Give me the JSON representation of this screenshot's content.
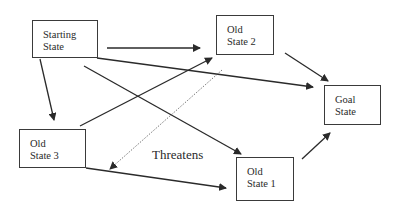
{
  "nodes": {
    "starting": {
      "line1": "Starting",
      "line2": "State"
    },
    "old2": {
      "line1": "Old",
      "line2": "State 2"
    },
    "goal": {
      "line1": "Goal",
      "line2": "State"
    },
    "old3": {
      "line1": "Old",
      "line2": "State 3"
    },
    "old1": {
      "line1": "Old",
      "line2": "State 1"
    }
  },
  "edges": [
    {
      "from": "Starting State",
      "to": "Old State 2",
      "style": "solid"
    },
    {
      "from": "Starting State",
      "to": "Goal State",
      "style": "solid"
    },
    {
      "from": "Starting State",
      "to": "Old State 3",
      "style": "solid"
    },
    {
      "from": "Starting State",
      "to": "Old State 1",
      "style": "solid"
    },
    {
      "from": "Old State 3",
      "to": "Old State 2",
      "style": "solid"
    },
    {
      "from": "Old State 3",
      "to": "Old State 1",
      "style": "solid"
    },
    {
      "from": "Old State 2",
      "to": "Goal State",
      "style": "solid"
    },
    {
      "from": "Old State 1",
      "to": "Goal State",
      "style": "solid"
    },
    {
      "from": "Old State 2",
      "to": "Old State 3",
      "style": "dotted",
      "label": "Threatens"
    }
  ],
  "annotations": {
    "threatens": "Threatens"
  }
}
